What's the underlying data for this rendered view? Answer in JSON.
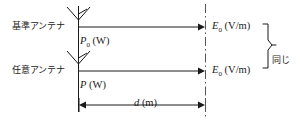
{
  "figure": {
    "background_color": "#ffffff",
    "line_color": "#1a1a1a",
    "width": 300,
    "height": 123
  },
  "rows": [
    {
      "antenna_label": "基準アンテナ",
      "power_label_name": "P",
      "power_subscript": "0",
      "power_unit": "(W)",
      "field_label_name": "E",
      "field_subscript": "0",
      "field_unit": "(V/m)"
    },
    {
      "antenna_label": "任意アンテナ",
      "power_label_name": "P",
      "power_subscript": "",
      "power_unit": "(W)",
      "field_label_name": "E",
      "field_subscript": "0",
      "field_unit": "(V/m)"
    }
  ],
  "brace": {
    "label": "同じ"
  },
  "distance": {
    "symbol": "d",
    "unit": "(m)"
  },
  "icons": {
    "antenna": "antenna-icon",
    "arrow_right": "arrow-right-icon",
    "dimension_arrow": "double-arrow-icon",
    "dash_dot_line": "dash-dot-line-icon",
    "brace": "curly-brace-icon"
  }
}
